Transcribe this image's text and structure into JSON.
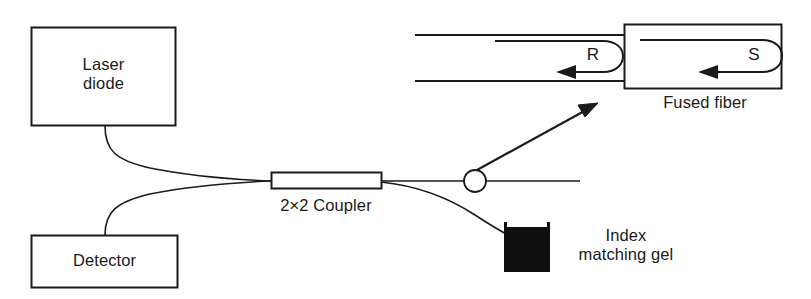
{
  "figure": {
    "type": "optical-fiber-interferometer-schematic",
    "background_color": "#ffffff",
    "stroke_color": "#1a1a1a",
    "fill_color": "#101010"
  },
  "components": {
    "laser_diode": {
      "label_line1": "Laser",
      "label_line2": "diode",
      "shape": "rectangle"
    },
    "detector": {
      "label": "Detector",
      "shape": "rectangle"
    },
    "coupler": {
      "label": "2×2 Coupler",
      "shape": "rectangle"
    },
    "index_matching_gel": {
      "label_line1": "Index",
      "label_line2": "matching gel",
      "shape": "filled-beaker"
    },
    "fused_fiber": {
      "label": "Fused fiber",
      "shape": "rectangle-inset"
    }
  },
  "annotations": {
    "reference_beam": "R",
    "sample_beam": "S",
    "callout": "magnified-detail-arrow",
    "probe_marker": "circle"
  }
}
